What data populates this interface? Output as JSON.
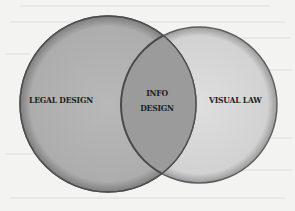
{
  "diagram": {
    "type": "venn",
    "background_color": "#f3f3f1",
    "sets": [
      {
        "id": "legal-design",
        "label": "LEGAL DESIGN",
        "fill": "#b3b3b3",
        "stroke": "#5a5a5a",
        "cx": 108,
        "cy": 104,
        "r": 88
      },
      {
        "id": "visual-law",
        "label": "VISUAL LAW",
        "fill": "#d9d9d9",
        "stroke": "#5a5a5a",
        "cx": 199,
        "cy": 105,
        "r": 78
      }
    ],
    "intersection": {
      "label_line1": "INFO",
      "label_line2": "DESIGN",
      "fill": "#9b9b9b"
    }
  }
}
